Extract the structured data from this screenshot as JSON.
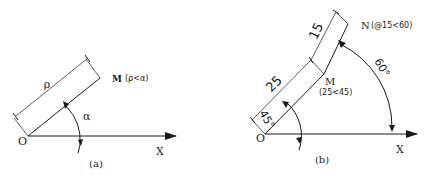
{
  "diagram_a": {
    "caption": "(a)",
    "origin_label": "O",
    "axis_label": "X",
    "point_label": "M",
    "point_coords": "(ρ<α)",
    "dimension_label": "ρ",
    "angle_label": "α"
  },
  "diagram_b": {
    "caption": "(b)",
    "origin_label": "O",
    "axis_label": "X",
    "point_m_label": "M",
    "point_m_coords": "(25<45)",
    "point_n_label": "N",
    "point_n_coords": "(@15<60)",
    "dimension_1": "25",
    "dimension_2": "15",
    "angle_1": "45°",
    "angle_2": "60°"
  }
}
